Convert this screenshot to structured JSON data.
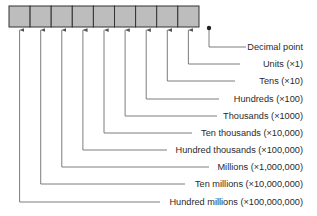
{
  "diagram": {
    "colors": {
      "cell_fill": "#bdbdbd",
      "cell_border": "#333333",
      "line": "#6e6e6e",
      "text": "#2a2a2a"
    },
    "register": {
      "cell_count": 9
    },
    "decimal_point_label": "Decimal point",
    "places": [
      {
        "name": "Units",
        "multiplier": "(×1)"
      },
      {
        "name": "Tens",
        "multiplier": "(×10)"
      },
      {
        "name": "Hundreds",
        "multiplier": "(×100)"
      },
      {
        "name": "Thousands",
        "multiplier": "(×1000)"
      },
      {
        "name": "Ten thousands",
        "multiplier": "(×10,000)"
      },
      {
        "name": "Hundred thousands",
        "multiplier": "(×100,000)"
      },
      {
        "name": "Millions",
        "multiplier": "(×1,000,000)"
      },
      {
        "name": "Ten millions",
        "multiplier": "(×10,000,000)"
      },
      {
        "name": "Hundred millions",
        "multiplier": "(×100,000,000)"
      }
    ],
    "labels": [
      "Decimal point",
      "Units (×1)",
      "Tens (×10)",
      "Hundreds (×100)",
      "Thousands (×1000)",
      "Ten thousands (×10,000)",
      "Hundred thousands (×100,000)",
      "Millions (×1,000,000)",
      "Ten millions (×10,000,000)",
      "Hundred millions (×100,000,000)"
    ]
  }
}
